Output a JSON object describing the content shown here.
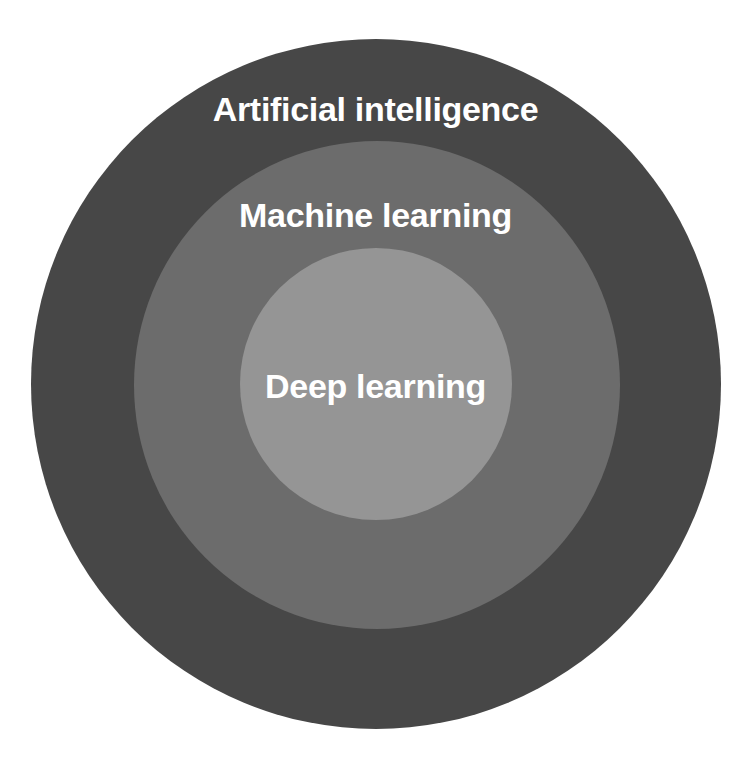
{
  "diagram": {
    "type": "nested-circles",
    "rings": [
      {
        "id": "outer",
        "label": "Artificial intelligence",
        "color": "#474747"
      },
      {
        "id": "middle",
        "label": "Machine learning",
        "color": "#6c6c6c"
      },
      {
        "id": "inner",
        "label": "Deep learning",
        "color": "#959595"
      }
    ],
    "text_color": "#ffffff",
    "background": "#ffffff"
  }
}
